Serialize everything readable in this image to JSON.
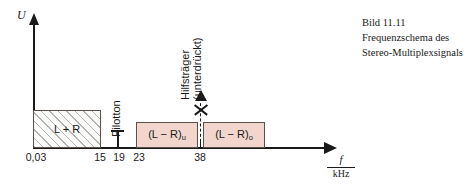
{
  "caption": {
    "figure_number": "Bild 11.11",
    "line1": "Frequenzschema des",
    "line2": "Stereo-Multiplexsignals"
  },
  "axes": {
    "y_label": "U",
    "x_label_numerator": "f",
    "x_label_denominator": "kHz"
  },
  "ticks": [
    {
      "label": "0,03",
      "value": 0.03,
      "x": 33
    },
    {
      "label": "15",
      "value": 15,
      "x": 100
    },
    {
      "label": "19",
      "value": 19,
      "x": 117
    },
    {
      "label": "23",
      "value": 23,
      "x": 136
    },
    {
      "label": "38",
      "value": 38,
      "x": 200
    }
  ],
  "blocks": [
    {
      "name": "mono-sum-signal",
      "label": "L + R",
      "label_sub": "",
      "from": 0.03,
      "to": 15,
      "fill": "hatched",
      "left": 33,
      "width": 68,
      "top": 110,
      "height": 38
    },
    {
      "name": "lower-sideband",
      "label": "(L − R)",
      "label_sub": "u",
      "from": 23,
      "to": 38,
      "fill": "pink",
      "left": 136,
      "width": 62,
      "top": 122,
      "height": 26
    },
    {
      "name": "upper-sideband",
      "label": "(L − R)",
      "label_sub": "o",
      "from": 38,
      "to": 53,
      "fill": "pink",
      "left": 203,
      "width": 62,
      "top": 122,
      "height": 26
    }
  ],
  "annotations": {
    "pilot_tone": "Pilotton",
    "carrier_line1": "Hilfsträger",
    "carrier_line2": "(unterdrückt)"
  },
  "colors": {
    "sideband_fill": "#f2d6cd",
    "block_border": "#5a5048",
    "ink": "#1a1a1a",
    "background": "#ffffff"
  }
}
